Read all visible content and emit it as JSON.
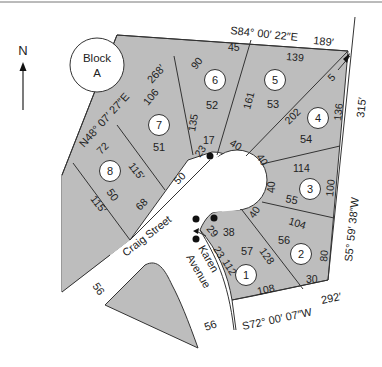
{
  "colors": {
    "lot_fill": "#bdbdbd",
    "line": "#333333",
    "background": "#ffffff"
  },
  "compass": {
    "label": "N",
    "icon": "north-arrow-icon"
  },
  "block": {
    "line1": "Block",
    "line2": "A"
  },
  "bearings": {
    "northwest": "N48° 07′ 27″E",
    "northwest_length": "268′",
    "north": "S84° 00′ 22″E",
    "north_length": "189′",
    "east": "S5° 59′ 38″W",
    "east_length": "315′",
    "south": "S72° 00′ 07″W",
    "south_length": "292′"
  },
  "streets": {
    "craig": "Craig Street",
    "karen_1": "Karen",
    "karen_2": "Avenue",
    "width_a": "56",
    "width_b": "56"
  },
  "lots": [
    {
      "number": "1",
      "area": "57",
      "dims": [
        "112",
        "108",
        "128",
        "38",
        "23",
        "29"
      ]
    },
    {
      "number": "2",
      "area": "56",
      "dims": [
        "104",
        "80",
        "30",
        "40"
      ]
    },
    {
      "number": "3",
      "area": "55",
      "dims": [
        "114",
        "100",
        "40"
      ]
    },
    {
      "number": "4",
      "area": "54",
      "dims": [
        "202",
        "136",
        "5",
        "40"
      ]
    },
    {
      "number": "5",
      "area": "53",
      "dims": [
        "139",
        "161",
        "40"
      ]
    },
    {
      "number": "6",
      "area": "52",
      "dims": [
        "45",
        "90",
        "135",
        "17",
        "23"
      ]
    },
    {
      "number": "7",
      "area": "51",
      "dims": [
        "106",
        "115′",
        "50"
      ]
    },
    {
      "number": "8",
      "area": "50",
      "dims": [
        "72",
        "115′",
        "68"
      ]
    }
  ]
}
